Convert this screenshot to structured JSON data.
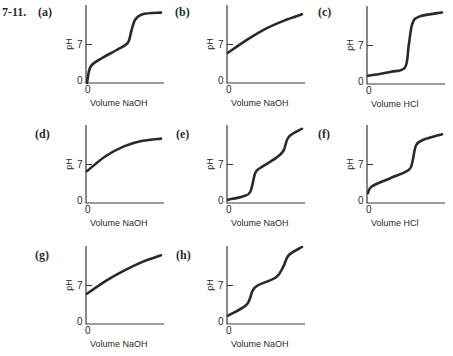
{
  "problem_number": "7-11.",
  "axis_text": {
    "ylabel": "pH",
    "y_tick_7": "7",
    "y_tick_0": "0",
    "x_tick_0": "0"
  },
  "panels": [
    {
      "label": "(a)",
      "xlabel": "Volume NaOH"
    },
    {
      "label": "(b)",
      "xlabel": "Volume NaOH"
    },
    {
      "label": "(c)",
      "xlabel": "Volume HCl"
    },
    {
      "label": "(d)",
      "xlabel": "Volume NaOH"
    },
    {
      "label": "(e)",
      "xlabel": "Volume NaOH"
    },
    {
      "label": "(f)",
      "xlabel": "Volume HCl"
    },
    {
      "label": "(g)",
      "xlabel": "Volume NaOH"
    },
    {
      "label": "(h)",
      "xlabel": "Volume NaOH"
    }
  ],
  "chart_data": [
    {
      "type": "line",
      "title": "(a)",
      "xlabel": "Volume NaOH",
      "ylabel": "pH",
      "yticks": [
        0,
        7
      ],
      "xticks": [
        0
      ],
      "description": "weak acid titrated with strong base; one equivalence point",
      "x": [
        0,
        0.05,
        0.2,
        0.4,
        0.55,
        0.6,
        0.65,
        0.75,
        1.0
      ],
      "y": [
        0,
        3,
        4.5,
        6,
        7.3,
        9.5,
        11.5,
        12.5,
        12.8
      ]
    },
    {
      "type": "line",
      "title": "(b)",
      "xlabel": "Volume NaOH",
      "ylabel": "pH",
      "yticks": [
        0,
        7
      ],
      "xticks": [
        0
      ],
      "description": "smooth gradual rise, no distinct end point",
      "x": [
        0,
        0.25,
        0.5,
        0.75,
        1.0
      ],
      "y": [
        5.5,
        7.8,
        9.8,
        11.3,
        12.5
      ]
    },
    {
      "type": "line",
      "title": "(c)",
      "xlabel": "Volume HCl",
      "ylabel": "pH",
      "yticks": [
        0,
        7
      ],
      "xticks": [
        0
      ],
      "description": "sharp rise after long flat region near pH 2",
      "x": [
        0,
        0.3,
        0.5,
        0.55,
        0.6,
        0.7,
        1.0
      ],
      "y": [
        1.5,
        2.2,
        3,
        7,
        11,
        12.3,
        13
      ]
    },
    {
      "type": "line",
      "title": "(d)",
      "xlabel": "Volume NaOH",
      "ylabel": "pH",
      "yticks": [
        0,
        7
      ],
      "xticks": [
        0
      ],
      "description": "smooth concave rise leveling off",
      "x": [
        0,
        0.25,
        0.5,
        0.75,
        1.0
      ],
      "y": [
        5.8,
        8.5,
        10.3,
        11.3,
        11.7
      ]
    },
    {
      "type": "line",
      "title": "(e)",
      "xlabel": "Volume NaOH",
      "ylabel": "pH",
      "yticks": [
        0,
        7
      ],
      "xticks": [
        0
      ],
      "description": "two equivalence points (diprotic)",
      "x": [
        0,
        0.2,
        0.3,
        0.37,
        0.45,
        0.65,
        0.75,
        0.82,
        1.0
      ],
      "y": [
        0.6,
        1.2,
        2,
        5.5,
        6.5,
        8.2,
        9.5,
        12,
        13.5
      ]
    },
    {
      "type": "line",
      "title": "(f)",
      "xlabel": "Volume HCl",
      "ylabel": "pH",
      "yticks": [
        0,
        7
      ],
      "xticks": [
        0
      ],
      "description": "gradual linear rise then jump near 60% volume",
      "x": [
        0,
        0.05,
        0.3,
        0.55,
        0.6,
        0.65,
        0.75,
        1.0
      ],
      "y": [
        1.8,
        3,
        4.5,
        6,
        7.5,
        10.5,
        11.5,
        12.5
      ]
    },
    {
      "type": "line",
      "title": "(g)",
      "xlabel": "Volume NaOH",
      "ylabel": "pH",
      "yticks": [
        0,
        7
      ],
      "xticks": [
        0
      ],
      "description": "smooth gradual rise",
      "x": [
        0,
        0.25,
        0.5,
        0.75,
        1.0
      ],
      "y": [
        5.5,
        7.8,
        9.7,
        11.3,
        12.5
      ]
    },
    {
      "type": "line",
      "title": "(h)",
      "xlabel": "Volume NaOH",
      "ylabel": "pH",
      "yticks": [
        0,
        7
      ],
      "xticks": [
        0
      ],
      "description": "two equivalence points with sloped buffer regions",
      "x": [
        0,
        0.25,
        0.33,
        0.4,
        0.65,
        0.75,
        0.82,
        1.0
      ],
      "y": [
        1.5,
        3.5,
        6,
        7,
        8.5,
        10.5,
        12.5,
        14
      ]
    }
  ]
}
